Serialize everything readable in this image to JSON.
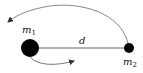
{
  "diagram": {
    "bodies": [
      {
        "id": "m1",
        "label": "m",
        "subscript": "1",
        "size": "large",
        "color": "#000000"
      },
      {
        "id": "m2",
        "label": "m",
        "subscript": "2",
        "size": "small",
        "color": "#000000"
      }
    ],
    "separation_label": "d",
    "arrows": [
      {
        "name": "outer-orbit-arrow",
        "around": "m2",
        "direction": "counterclockwise"
      },
      {
        "name": "inner-orbit-arrow",
        "around": "m1",
        "direction": "counterclockwise"
      }
    ],
    "colors": {
      "stroke": "#555555",
      "body": "#000000",
      "text": "#111111"
    }
  }
}
